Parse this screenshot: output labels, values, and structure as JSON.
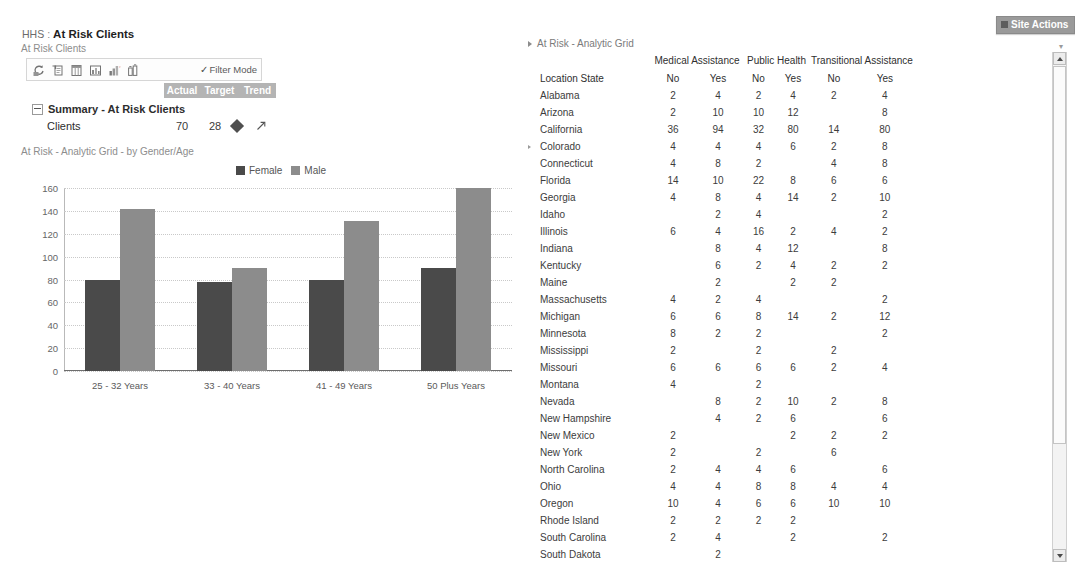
{
  "site_actions": {
    "label": "Site Actions"
  },
  "breadcrumb": {
    "root": "HHS",
    "separator": ":",
    "current": "At Risk Clients"
  },
  "scorecard": {
    "title": "At Risk Clients",
    "toolbar": {
      "icons": [
        "refresh-icon",
        "export-icon",
        "columns-icon",
        "chart-icon",
        "bar-chart-icon",
        "details-icon"
      ],
      "filter_mode_label": "Filter Mode"
    },
    "columns": [
      "Actual",
      "Target",
      "Trend"
    ],
    "group_label": "Summary - At Risk Clients",
    "rows": [
      {
        "name": "Clients",
        "actual": "70",
        "target": "28",
        "indicator": "diamond-indicator",
        "trend": "up-right-arrow"
      }
    ]
  },
  "chart": {
    "title": "At Risk - Analytic Grid - by Gender/Age",
    "colors": {
      "female": "#4a4a4a",
      "male": "#8c8c8c"
    }
  },
  "chart_data": {
    "type": "bar",
    "title": "At Risk - Analytic Grid - by Gender/Age",
    "xlabel": "",
    "ylabel": "",
    "ylim": [
      0,
      160
    ],
    "yticks": [
      0,
      20,
      40,
      60,
      80,
      100,
      120,
      140,
      160
    ],
    "grid": true,
    "legend_position": "top-center",
    "categories": [
      "25 - 32 Years",
      "33 - 40 Years",
      "41 - 49 Years",
      "50 Plus Years"
    ],
    "series": [
      {
        "name": "Female",
        "color": "#4a4a4a",
        "values": [
          80,
          78,
          80,
          90
        ]
      },
      {
        "name": "Male",
        "color": "#8c8c8c",
        "values": [
          142,
          90,
          131,
          160
        ]
      }
    ]
  },
  "grid": {
    "title": "At Risk - Analytic Grid",
    "group_headers": [
      {
        "label": "",
        "span": 1
      },
      {
        "label": "Medical Assistance",
        "span": 2
      },
      {
        "label": "Public Health",
        "span": 2
      },
      {
        "label": "Transitional Assistance",
        "span": 2
      }
    ],
    "sub_headers": [
      "Location State",
      "No",
      "Yes",
      "No",
      "Yes",
      "No",
      "Yes"
    ],
    "rows": [
      {
        "state": "Alabama",
        "ma_no": "2",
        "ma_yes": "4",
        "ph_no": "2",
        "ph_yes": "4",
        "ta_no": "2",
        "ta_yes": "4"
      },
      {
        "state": "Arizona",
        "ma_no": "2",
        "ma_yes": "10",
        "ph_no": "10",
        "ph_yes": "12",
        "ta_no": "",
        "ta_yes": "8"
      },
      {
        "state": "California",
        "ma_no": "36",
        "ma_yes": "94",
        "ph_no": "32",
        "ph_yes": "80",
        "ta_no": "14",
        "ta_yes": "80"
      },
      {
        "state": "Colorado",
        "ma_no": "4",
        "ma_yes": "4",
        "ph_no": "4",
        "ph_yes": "6",
        "ta_no": "2",
        "ta_yes": "8"
      },
      {
        "state": "Connecticut",
        "ma_no": "4",
        "ma_yes": "8",
        "ph_no": "2",
        "ph_yes": "",
        "ta_no": "4",
        "ta_yes": "8"
      },
      {
        "state": "Florida",
        "ma_no": "14",
        "ma_yes": "10",
        "ph_no": "22",
        "ph_yes": "8",
        "ta_no": "6",
        "ta_yes": "6"
      },
      {
        "state": "Georgia",
        "ma_no": "4",
        "ma_yes": "8",
        "ph_no": "4",
        "ph_yes": "14",
        "ta_no": "2",
        "ta_yes": "10"
      },
      {
        "state": "Idaho",
        "ma_no": "",
        "ma_yes": "2",
        "ph_no": "4",
        "ph_yes": "",
        "ta_no": "",
        "ta_yes": "2"
      },
      {
        "state": "Illinois",
        "ma_no": "6",
        "ma_yes": "4",
        "ph_no": "16",
        "ph_yes": "2",
        "ta_no": "4",
        "ta_yes": "2"
      },
      {
        "state": "Indiana",
        "ma_no": "",
        "ma_yes": "8",
        "ph_no": "4",
        "ph_yes": "12",
        "ta_no": "",
        "ta_yes": "8"
      },
      {
        "state": "Kentucky",
        "ma_no": "",
        "ma_yes": "6",
        "ph_no": "2",
        "ph_yes": "4",
        "ta_no": "2",
        "ta_yes": "2"
      },
      {
        "state": "Maine",
        "ma_no": "",
        "ma_yes": "2",
        "ph_no": "",
        "ph_yes": "2",
        "ta_no": "2",
        "ta_yes": ""
      },
      {
        "state": "Massachusetts",
        "ma_no": "4",
        "ma_yes": "2",
        "ph_no": "4",
        "ph_yes": "",
        "ta_no": "",
        "ta_yes": "2"
      },
      {
        "state": "Michigan",
        "ma_no": "6",
        "ma_yes": "6",
        "ph_no": "8",
        "ph_yes": "14",
        "ta_no": "2",
        "ta_yes": "12"
      },
      {
        "state": "Minnesota",
        "ma_no": "8",
        "ma_yes": "2",
        "ph_no": "2",
        "ph_yes": "",
        "ta_no": "",
        "ta_yes": "2"
      },
      {
        "state": "Mississippi",
        "ma_no": "2",
        "ma_yes": "",
        "ph_no": "2",
        "ph_yes": "",
        "ta_no": "2",
        "ta_yes": ""
      },
      {
        "state": "Missouri",
        "ma_no": "6",
        "ma_yes": "6",
        "ph_no": "6",
        "ph_yes": "6",
        "ta_no": "2",
        "ta_yes": "4"
      },
      {
        "state": "Montana",
        "ma_no": "4",
        "ma_yes": "",
        "ph_no": "2",
        "ph_yes": "",
        "ta_no": "",
        "ta_yes": ""
      },
      {
        "state": "Nevada",
        "ma_no": "",
        "ma_yes": "8",
        "ph_no": "2",
        "ph_yes": "10",
        "ta_no": "2",
        "ta_yes": "8"
      },
      {
        "state": "New Hampshire",
        "ma_no": "",
        "ma_yes": "4",
        "ph_no": "2",
        "ph_yes": "6",
        "ta_no": "",
        "ta_yes": "6"
      },
      {
        "state": "New Mexico",
        "ma_no": "2",
        "ma_yes": "",
        "ph_no": "",
        "ph_yes": "2",
        "ta_no": "2",
        "ta_yes": "2"
      },
      {
        "state": "New York",
        "ma_no": "2",
        "ma_yes": "",
        "ph_no": "2",
        "ph_yes": "",
        "ta_no": "6",
        "ta_yes": ""
      },
      {
        "state": "North Carolina",
        "ma_no": "2",
        "ma_yes": "4",
        "ph_no": "4",
        "ph_yes": "6",
        "ta_no": "",
        "ta_yes": "6"
      },
      {
        "state": "Ohio",
        "ma_no": "4",
        "ma_yes": "4",
        "ph_no": "8",
        "ph_yes": "8",
        "ta_no": "4",
        "ta_yes": "4"
      },
      {
        "state": "Oregon",
        "ma_no": "10",
        "ma_yes": "4",
        "ph_no": "6",
        "ph_yes": "6",
        "ta_no": "10",
        "ta_yes": "10"
      },
      {
        "state": "Rhode Island",
        "ma_no": "2",
        "ma_yes": "2",
        "ph_no": "2",
        "ph_yes": "2",
        "ta_no": "",
        "ta_yes": ""
      },
      {
        "state": "South Carolina",
        "ma_no": "2",
        "ma_yes": "4",
        "ph_no": "",
        "ph_yes": "2",
        "ta_no": "",
        "ta_yes": "2"
      },
      {
        "state": "South Dakota",
        "ma_no": "",
        "ma_yes": "2",
        "ph_no": "",
        "ph_yes": "",
        "ta_no": "",
        "ta_yes": ""
      }
    ]
  }
}
